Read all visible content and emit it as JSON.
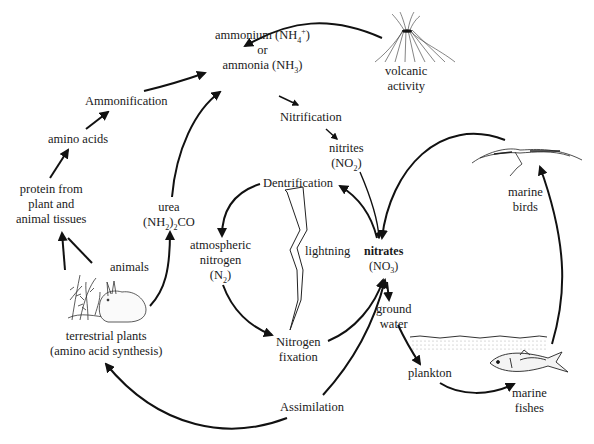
{
  "diagram": {
    "nodes": {
      "ammonium": {
        "line1": "ammonium (NH",
        "sub1": "4",
        "sup1": "+",
        "end1": ")",
        "line2": "or",
        "line3": "ammonia (NH",
        "sub3": "3",
        "end3": ")"
      },
      "volcanic": {
        "line1": "volcanic",
        "line2": "activity"
      },
      "ammonification": {
        "label": "Ammonification"
      },
      "amino_acids": {
        "label": "amino acids"
      },
      "nitrification": {
        "label": "Nitrification"
      },
      "nitrites": {
        "line1": "nitrites",
        "line2a": "(NO",
        "sub2": "2",
        "line2b": ")"
      },
      "protein": {
        "line1": "protein from",
        "line2": "plant and",
        "line3": "animal tissues"
      },
      "urea": {
        "line1": "urea",
        "line2a": "(NH",
        "sub2a": "2",
        "line2b": ")",
        "sub2b": "2",
        "line2c": "CO"
      },
      "dentrification": {
        "label": "Dentrification"
      },
      "marine_birds": {
        "line1": "marine",
        "line2": "birds"
      },
      "atmospheric": {
        "line1": "atmospheric",
        "line2": "nitrogen",
        "line3a": "(N",
        "sub3": "2",
        "line3b": ")"
      },
      "lightning": {
        "label": "lightning"
      },
      "nitrates": {
        "line1": "nitrates",
        "line2a": "(NO",
        "sub2": "3",
        "line2b": ")"
      },
      "animals": {
        "label": "animals"
      },
      "nitrogen_fixation": {
        "line1": "Nitrogen",
        "line2": "fixation"
      },
      "ground_water": {
        "line1": "ground",
        "line2": "water"
      },
      "terrestrial": {
        "line1": "terrestrial plants",
        "line2": "(amino acid synthesis)"
      },
      "plankton": {
        "label": "plankton"
      },
      "marine_fishes": {
        "line1": "marine",
        "line2": "fishes"
      },
      "assimilation": {
        "label": "Assimilation"
      }
    },
    "illustrations": [
      "volcano-illustration",
      "seabird-illustration",
      "rabbit-plants-illustration",
      "fish-illustration",
      "lightning-bolt",
      "water-surface"
    ],
    "colors": {
      "ink": "#111111",
      "background": "#ffffff"
    }
  }
}
